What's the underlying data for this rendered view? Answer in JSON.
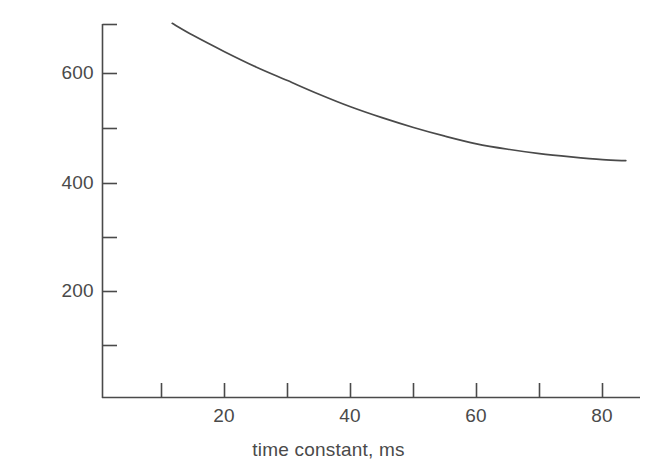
{
  "chart_data": {
    "type": "line",
    "title": "",
    "xlabel": "time constant, ms",
    "ylabel": "voltage rating, V",
    "xlim": [
      0.6,
      83.7
    ],
    "ylim": [
      0,
      690
    ],
    "grid": false,
    "legend": null,
    "x_ticks": [
      10,
      20,
      30,
      40,
      50,
      60,
      70,
      80
    ],
    "x_tick_labels": [
      "",
      "20",
      "",
      "40",
      "",
      "60",
      "",
      "80"
    ],
    "y_ticks": [
      100,
      200,
      300,
      400,
      500,
      600
    ],
    "y_tick_labels": [
      "",
      "200",
      "",
      "400",
      "",
      "600"
    ],
    "series": [
      {
        "name": "voltage rating vs time constant",
        "color": "#4a4a4a",
        "x": [
          11.7,
          15,
          20,
          25,
          30,
          35,
          40,
          45,
          50,
          55,
          60,
          65,
          70,
          75,
          80,
          83.7
        ],
        "y": [
          692,
          670,
          640,
          612,
          587,
          562,
          539,
          519,
          501,
          485,
          471,
          461,
          453,
          447,
          442,
          440
        ]
      }
    ]
  },
  "axis_labels": {
    "x_title": "time constant, ms",
    "y_title": "voltage rating, V",
    "x_visible_ticks": [
      {
        "value": "20",
        "px": 224
      },
      {
        "value": "40",
        "px": 350
      },
      {
        "value": "60",
        "px": 476
      },
      {
        "value": "80",
        "px": 602
      }
    ],
    "y_visible_ticks": [
      {
        "value": "600",
        "px": 73
      },
      {
        "value": "400",
        "px": 183
      },
      {
        "value": "200",
        "px": 291
      }
    ]
  },
  "colors": {
    "background": "#ffffff",
    "axis": "#4a4a4a",
    "curve": "#4a4a4a",
    "text": "#4a4a4a"
  }
}
